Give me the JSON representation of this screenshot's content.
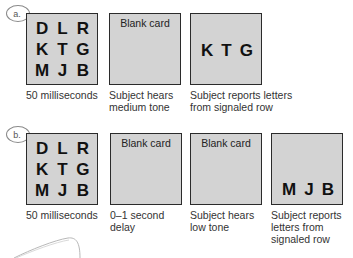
{
  "panel_a": {
    "label": "a.",
    "grid_letters": [
      "D",
      "L",
      "R",
      "K",
      "T",
      "G",
      "M",
      "J",
      "B"
    ],
    "cards": [
      {
        "title": "",
        "caption": "50 milliseconds"
      },
      {
        "title": "Blank card",
        "caption": "Subject hears\nmedium tone"
      },
      {
        "title": "",
        "caption": "Subject reports letters\nfrom signaled row",
        "reported_letters": [
          "K",
          "T",
          "G"
        ]
      }
    ]
  },
  "panel_b": {
    "label": "b.",
    "grid_letters": [
      "D",
      "L",
      "R",
      "K",
      "T",
      "G",
      "M",
      "J",
      "B"
    ],
    "cards": [
      {
        "title": "",
        "caption": "50 milliseconds"
      },
      {
        "title": "Blank card",
        "caption": "0–1 second\ndelay"
      },
      {
        "title": "Blank card",
        "caption": "Subject hears\nlow tone"
      },
      {
        "title": "",
        "caption": "Subject reports\nletters from\nsignaled row",
        "reported_letters": [
          "M",
          "J",
          "B"
        ]
      }
    ]
  },
  "colors": {
    "card_fill": "#d3d3d3",
    "card_border": "#2b2b2b",
    "text": "#333333"
  }
}
